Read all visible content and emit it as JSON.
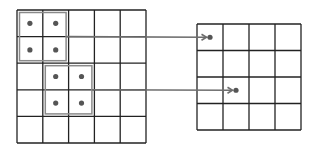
{
  "diagram": {
    "colors": {
      "grid_line": "#222222",
      "highlight_box": "#8a8a8a",
      "dot": "#555555",
      "arrow": "#6e6e6e",
      "background": "#ffffff"
    },
    "input_grid": {
      "rows": 5,
      "cols": 5,
      "x": 17,
      "y": 10,
      "cell_w": 25.8,
      "cell_h": 26.6
    },
    "output_grid": {
      "rows": 4,
      "cols": 4,
      "x": 197,
      "y": 24,
      "cell_w": 26,
      "cell_h": 26.5
    },
    "regions": [
      {
        "name": "region-1",
        "row": 0,
        "col": 0,
        "size": 2,
        "dots": [
          [
            0,
            0
          ],
          [
            0,
            1
          ],
          [
            1,
            0
          ],
          [
            1,
            1
          ]
        ],
        "target": {
          "row": 0,
          "col": 0
        }
      },
      {
        "name": "region-2",
        "row": 2,
        "col": 1,
        "size": 2,
        "dots": [
          [
            2,
            1
          ],
          [
            2,
            2
          ],
          [
            3,
            1
          ],
          [
            3,
            2
          ]
        ],
        "target": {
          "row": 2,
          "col": 1
        }
      }
    ]
  }
}
